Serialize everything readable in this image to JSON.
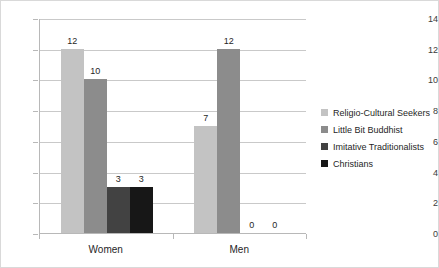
{
  "chart_data": {
    "type": "bar",
    "title": "",
    "subtitle": "",
    "xlabel": "",
    "ylabel": "",
    "categories": [
      "Women",
      "Men"
    ],
    "ylim": [
      0,
      14
    ],
    "yticks": [
      0,
      2,
      4,
      6,
      8,
      10,
      12,
      14
    ],
    "ytick_labels": [
      "0",
      "2",
      "4",
      "6",
      "8",
      "10",
      "12",
      "14"
    ],
    "grid": true,
    "legend_position": "right",
    "data_labels": true,
    "series": [
      {
        "name": "Religio-Cultural Seekers",
        "color": "#c3c3c3",
        "values": [
          12,
          7
        ],
        "value_labels": [
          "12",
          "7"
        ]
      },
      {
        "name": "Little Bit Buddhist",
        "color": "#8c8c8c",
        "values": [
          10,
          12
        ],
        "value_labels": [
          "10",
          "12"
        ]
      },
      {
        "name": "Imitative Traditionalists",
        "color": "#424242",
        "values": [
          3,
          0
        ],
        "value_labels": [
          "3",
          "0"
        ]
      },
      {
        "name": "Christians",
        "color": "#171717",
        "values": [
          3,
          0
        ],
        "value_labels": [
          "3",
          "0"
        ]
      }
    ]
  }
}
